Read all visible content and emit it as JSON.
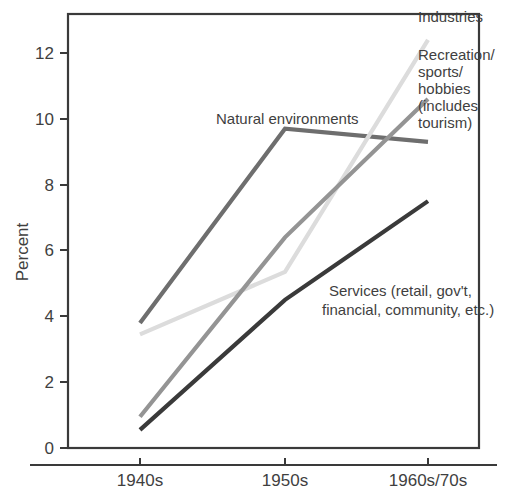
{
  "chart_data": {
    "type": "line",
    "title": "",
    "xlabel": "",
    "ylabel": "Percent",
    "categories": [
      "1940s",
      "1950s",
      "1960s/70s"
    ],
    "ylim": [
      0,
      12.9
    ],
    "xlim": [
      0,
      2
    ],
    "yticks": [
      0,
      2,
      4,
      6,
      8,
      10,
      12
    ],
    "ytick_labels": [
      "0",
      "2",
      "4",
      "6",
      "8",
      "10",
      "12"
    ],
    "grid": false,
    "legend_position": "inline-annotations",
    "series": [
      {
        "name": "Natural environments",
        "values": [
          3.8,
          9.7,
          9.3
        ],
        "color": "#6e6e6e",
        "stroke_width": 4.2
      },
      {
        "name": "Industries",
        "values": [
          3.45,
          5.35,
          12.4
        ],
        "color": "#dcdcdc",
        "stroke_width": 4.2
      },
      {
        "name": "Recreation/sports/hobbies (includes tourism)",
        "values": [
          0.95,
          6.4,
          10.6
        ],
        "color": "#949494",
        "stroke_width": 4.2
      },
      {
        "name": "Services (retail, gov't, financial, community, etc.)",
        "values": [
          0.55,
          4.5,
          7.5
        ],
        "color": "#3a3a3a",
        "stroke_width": 4.2
      }
    ],
    "annotations": [
      {
        "id": "industries",
        "lines": [
          "Industries"
        ]
      },
      {
        "id": "recreation",
        "lines": [
          "Recreation/",
          "sports/",
          "hobbies",
          "(includes",
          "tourism)"
        ]
      },
      {
        "id": "natural-environments",
        "lines": [
          "Natural environments"
        ]
      },
      {
        "id": "services",
        "lines": [
          "Services (retail, gov't,",
          "financial, community, etc.)"
        ]
      }
    ],
    "colors": {
      "axis": "#3a3a3a",
      "text": "#3f3f3f",
      "background": "#ffffff",
      "natural_environments": "#6e6e6e",
      "industries": "#dcdcdc",
      "recreation": "#949494",
      "services": "#3a3a3a"
    }
  }
}
